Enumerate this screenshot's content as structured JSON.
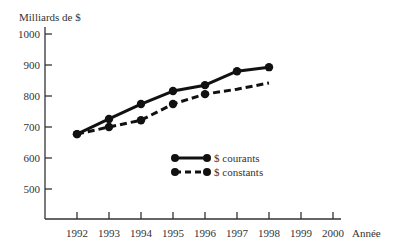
{
  "chart_data": {
    "type": "line",
    "title": "",
    "ylabel": "Milliards de $",
    "xlabel": "Année",
    "ylim": [
      400,
      1000
    ],
    "yticks": [
      500,
      600,
      700,
      800,
      900,
      1000
    ],
    "xticks": [
      1992,
      1993,
      1994,
      1995,
      1996,
      1997,
      1998,
      1999,
      2000
    ],
    "grid": false,
    "legend_position": "center",
    "x": [
      1992,
      1993,
      1994,
      1995,
      1996,
      1997,
      1998
    ],
    "series": [
      {
        "name": "$ courants",
        "style": "solid",
        "markers": [
          1992,
          1993,
          1994,
          1995,
          1996,
          1997,
          1998
        ],
        "values": [
          677,
          726,
          774,
          816,
          835,
          880,
          893
        ]
      },
      {
        "name": "$ constants",
        "style": "dashed",
        "markers": [
          1992,
          1993,
          1994,
          1995,
          1996
        ],
        "values": [
          677,
          700,
          722,
          774,
          806,
          822,
          842
        ]
      }
    ]
  },
  "axis": {
    "ylabel": "Milliards de $",
    "xlabel": "Année",
    "yticks": [
      "500",
      "600",
      "700",
      "800",
      "900",
      "1000"
    ],
    "xticks": [
      "1992",
      "1993",
      "1994",
      "1995",
      "1996",
      "1997",
      "1998",
      "1999",
      "2000"
    ]
  },
  "legend": {
    "solid_label": "$ courants",
    "dashed_label": "$ constants"
  }
}
